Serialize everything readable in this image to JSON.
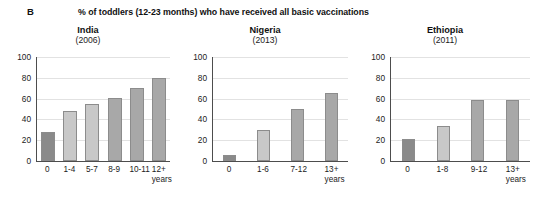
{
  "figure": {
    "panel_letter": "B",
    "title": "% of toddlers (12-23 months) who have received all basic vaccinations"
  },
  "chart_data": {
    "type": "bar",
    "title": "% of toddlers (12-23 months) who have received all basic vaccinations",
    "panel_label": "B",
    "ylabel": "",
    "xlabel": "years",
    "ylim": [
      0,
      100
    ],
    "yticks": [
      0,
      20,
      40,
      60,
      80,
      100
    ],
    "grid": true,
    "legend": "none",
    "colors": {
      "dark_gray": "#8a8a8a",
      "light_gray": "#c8c8c8",
      "medium_gray": "#a8a8a8",
      "gridline": "#e2e2e2",
      "axis": "#4d4d4d"
    },
    "panels": [
      {
        "country": "India",
        "year": "(2006)",
        "units": "years",
        "categories": [
          "0",
          "1-4",
          "5-7",
          "8-9",
          "10-11",
          "12+"
        ],
        "values": [
          28,
          48,
          55,
          61,
          70,
          80
        ],
        "bar_shades": [
          "dark_gray",
          "light_gray",
          "light_gray",
          "medium_gray",
          "medium_gray",
          "medium_gray"
        ]
      },
      {
        "country": "Nigeria",
        "year": "(2013)",
        "units": "years",
        "categories": [
          "0",
          "1-6",
          "7-12",
          "13+"
        ],
        "values": [
          6,
          30,
          50,
          65
        ],
        "bar_shades": [
          "dark_gray",
          "light_gray",
          "medium_gray",
          "medium_gray"
        ]
      },
      {
        "country": "Ethiopia",
        "year": "(2011)",
        "units": "years",
        "categories": [
          "0",
          "1-8",
          "9-12",
          "13+"
        ],
        "values": [
          21,
          34,
          59,
          59
        ],
        "bar_shades": [
          "dark_gray",
          "light_gray",
          "medium_gray",
          "medium_gray"
        ]
      }
    ]
  }
}
